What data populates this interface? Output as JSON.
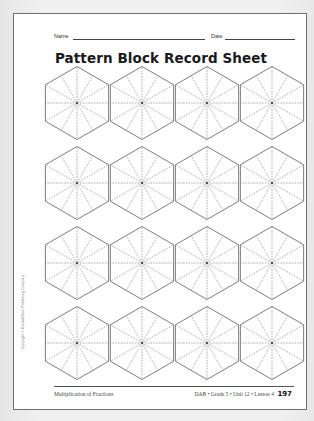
{
  "header": {
    "name_label": "Name",
    "date_label": "Date",
    "title": "Pattern Block Record Sheet"
  },
  "grid": {
    "rows": 4,
    "columns": 4,
    "shape": "hexagon",
    "division_lines": 12
  },
  "side_note": "Copyright © Kendall/Hunt Publishing Company",
  "footer": {
    "left": "Multiplication of Fractions",
    "right": "DAB • Grade 5 • Unit 12 • Lesson 4",
    "page_number": "197"
  },
  "colors": {
    "background": "#ececec",
    "page": "#ffffff",
    "outline": "#6e6e6e",
    "dashed": "#777777"
  }
}
